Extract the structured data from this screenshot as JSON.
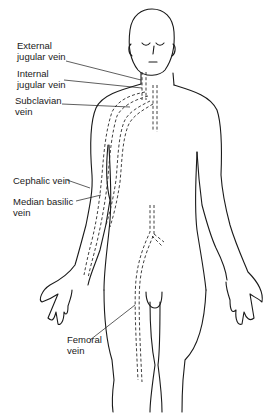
{
  "figure": {
    "labels": [
      {
        "id": "external-jugular",
        "text": "External\njugular vein",
        "x": 17,
        "y": 40
      },
      {
        "id": "internal-jugular",
        "text": "Internal\njugular vein",
        "x": 17,
        "y": 68
      },
      {
        "id": "subclavian",
        "text": "Subclavian\nvein",
        "x": 15,
        "y": 95
      },
      {
        "id": "cephalic",
        "text": "Cephalic vein",
        "x": 13,
        "y": 175
      },
      {
        "id": "median-basilic",
        "text": "Median basilic\nvein",
        "x": 13,
        "y": 196
      },
      {
        "id": "femoral",
        "text": "Femoral\nvein",
        "x": 67,
        "y": 334
      }
    ]
  }
}
